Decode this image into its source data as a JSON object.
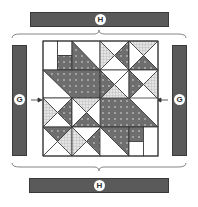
{
  "diagram": {
    "type": "quilt-assembly",
    "labels": {
      "top_border": "H",
      "bottom_border": "H",
      "left_border": "G",
      "right_border": "G"
    },
    "colors": {
      "border_fill": "#5a5a5a",
      "dark_fabric": "#6e6e6e",
      "check_fabric": "#c8c8c8",
      "light_fabric": "#ffffff",
      "outline": "#333333"
    },
    "center": {
      "grid": "4x4 units",
      "description": "Four pieced blocks with hourglass and half-square triangle units"
    }
  }
}
